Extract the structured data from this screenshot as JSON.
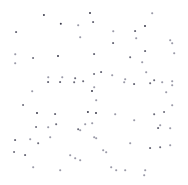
{
  "figure": {
    "width": 188,
    "height": 185,
    "background_color": "#ffffff",
    "marker_color": "#3a3a4a",
    "marker_color_faint": "#9a9aa8",
    "has_axes": false,
    "has_frame": false,
    "has_title": false,
    "has_legend": false,
    "has_gridlines": false,
    "has_tick_labels": false
  },
  "chart_data": {
    "type": "scatter",
    "title": "",
    "subtitle": "",
    "xlabel": "",
    "ylabel": "",
    "xlim": [
      0,
      188
    ],
    "ylim": [
      0,
      185
    ],
    "grid": false,
    "legend": null,
    "annotations": [],
    "tick_labels": {
      "x": [],
      "y": []
    },
    "series": [
      {
        "name": "points",
        "color": "#3a3a4a",
        "marker": "circle",
        "marker_size": 2,
        "n_points": 92,
        "points": [
          {
            "x": 44,
            "y": 15,
            "size": 2.2,
            "shade": "dark"
          },
          {
            "x": 90,
            "y": 13,
            "size": 2.0,
            "shade": "dark"
          },
          {
            "x": 152,
            "y": 13,
            "size": 1.6,
            "shade": "faint"
          },
          {
            "x": 61,
            "y": 24,
            "size": 2.4,
            "shade": "dark"
          },
          {
            "x": 16,
            "y": 32,
            "size": 1.8,
            "shade": "mid"
          },
          {
            "x": 78,
            "y": 25,
            "size": 1.6,
            "shade": "faint"
          },
          {
            "x": 93,
            "y": 22,
            "size": 1.8,
            "shade": "mid"
          },
          {
            "x": 113,
            "y": 31,
            "size": 1.5,
            "shade": "faint"
          },
          {
            "x": 135,
            "y": 31,
            "size": 1.8,
            "shade": "mid"
          },
          {
            "x": 145,
            "y": 26,
            "size": 2.0,
            "shade": "dark"
          },
          {
            "x": 80,
            "y": 37,
            "size": 1.6,
            "shade": "faint"
          },
          {
            "x": 136,
            "y": 38,
            "size": 1.6,
            "shade": "faint"
          },
          {
            "x": 170,
            "y": 40,
            "size": 1.6,
            "shade": "faint"
          },
          {
            "x": 113,
            "y": 43,
            "size": 1.8,
            "shade": "mid"
          },
          {
            "x": 172,
            "y": 43,
            "size": 1.6,
            "shade": "faint"
          },
          {
            "x": 15,
            "y": 54,
            "size": 1.5,
            "shade": "faint"
          },
          {
            "x": 33,
            "y": 58,
            "size": 1.9,
            "shade": "mid"
          },
          {
            "x": 58,
            "y": 56,
            "size": 2.0,
            "shade": "dark"
          },
          {
            "x": 94,
            "y": 54,
            "size": 1.8,
            "shade": "mid"
          },
          {
            "x": 130,
            "y": 57,
            "size": 1.7,
            "shade": "mid"
          },
          {
            "x": 145,
            "y": 51,
            "size": 1.8,
            "shade": "mid"
          },
          {
            "x": 174,
            "y": 53,
            "size": 1.6,
            "shade": "faint"
          },
          {
            "x": 15,
            "y": 63,
            "size": 1.6,
            "shade": "faint"
          },
          {
            "x": 142,
            "y": 62,
            "size": 1.6,
            "shade": "faint"
          },
          {
            "x": 146,
            "y": 72,
            "size": 1.6,
            "shade": "faint"
          },
          {
            "x": 48,
            "y": 77,
            "size": 1.5,
            "shade": "faint"
          },
          {
            "x": 62,
            "y": 77,
            "size": 1.5,
            "shade": "faint"
          },
          {
            "x": 75,
            "y": 78,
            "size": 1.7,
            "shade": "mid"
          },
          {
            "x": 94,
            "y": 74,
            "size": 1.9,
            "shade": "mid"
          },
          {
            "x": 101,
            "y": 72,
            "size": 1.8,
            "shade": "mid"
          },
          {
            "x": 112,
            "y": 75,
            "size": 1.6,
            "shade": "faint"
          },
          {
            "x": 125,
            "y": 79,
            "size": 1.6,
            "shade": "faint"
          },
          {
            "x": 154,
            "y": 80,
            "size": 1.7,
            "shade": "mid"
          },
          {
            "x": 172,
            "y": 81,
            "size": 1.6,
            "shade": "faint"
          },
          {
            "x": 48,
            "y": 82,
            "size": 1.8,
            "shade": "mid"
          },
          {
            "x": 60,
            "y": 82,
            "size": 1.8,
            "shade": "mid"
          },
          {
            "x": 74,
            "y": 82,
            "size": 1.7,
            "shade": "mid"
          },
          {
            "x": 83,
            "y": 81,
            "size": 1.7,
            "shade": "mid"
          },
          {
            "x": 92,
            "y": 91,
            "size": 2.0,
            "shade": "dark"
          },
          {
            "x": 32,
            "y": 91,
            "size": 1.6,
            "shade": "faint"
          },
          {
            "x": 124,
            "y": 82,
            "size": 1.6,
            "shade": "faint"
          },
          {
            "x": 134,
            "y": 84,
            "size": 1.8,
            "shade": "mid"
          },
          {
            "x": 150,
            "y": 83,
            "size": 1.7,
            "shade": "mid"
          },
          {
            "x": 162,
            "y": 82,
            "size": 1.6,
            "shade": "faint"
          },
          {
            "x": 172,
            "y": 85,
            "size": 1.6,
            "shade": "faint"
          },
          {
            "x": 94,
            "y": 87,
            "size": 1.6,
            "shade": "faint"
          },
          {
            "x": 166,
            "y": 92,
            "size": 1.6,
            "shade": "faint"
          },
          {
            "x": 23,
            "y": 105,
            "size": 1.9,
            "shade": "mid"
          },
          {
            "x": 96,
            "y": 100,
            "size": 1.6,
            "shade": "faint"
          },
          {
            "x": 172,
            "y": 105,
            "size": 1.6,
            "shade": "faint"
          },
          {
            "x": 37,
            "y": 113,
            "size": 2.0,
            "shade": "dark"
          },
          {
            "x": 55,
            "y": 114,
            "size": 1.8,
            "shade": "mid"
          },
          {
            "x": 88,
            "y": 112,
            "size": 2.2,
            "shade": "dark"
          },
          {
            "x": 96,
            "y": 113,
            "size": 2.0,
            "shade": "dark"
          },
          {
            "x": 115,
            "y": 114,
            "size": 1.6,
            "shade": "faint"
          },
          {
            "x": 134,
            "y": 120,
            "size": 1.6,
            "shade": "faint"
          },
          {
            "x": 154,
            "y": 114,
            "size": 1.7,
            "shade": "mid"
          },
          {
            "x": 164,
            "y": 112,
            "size": 1.9,
            "shade": "mid"
          },
          {
            "x": 56,
            "y": 124,
            "size": 1.7,
            "shade": "mid"
          },
          {
            "x": 85,
            "y": 124,
            "size": 1.6,
            "shade": "faint"
          },
          {
            "x": 92,
            "y": 123,
            "size": 1.6,
            "shade": "faint"
          },
          {
            "x": 160,
            "y": 125,
            "size": 1.6,
            "shade": "faint"
          },
          {
            "x": 36,
            "y": 127,
            "size": 1.9,
            "shade": "mid"
          },
          {
            "x": 48,
            "y": 127,
            "size": 1.6,
            "shade": "faint"
          },
          {
            "x": 78,
            "y": 129,
            "size": 1.7,
            "shade": "mid"
          },
          {
            "x": 158,
            "y": 128,
            "size": 1.8,
            "shade": "mid"
          },
          {
            "x": 170,
            "y": 128,
            "size": 1.6,
            "shade": "faint"
          },
          {
            "x": 15,
            "y": 140,
            "size": 1.8,
            "shade": "mid"
          },
          {
            "x": 30,
            "y": 139,
            "size": 1.6,
            "shade": "faint"
          },
          {
            "x": 38,
            "y": 143,
            "size": 1.7,
            "shade": "mid"
          },
          {
            "x": 50,
            "y": 137,
            "size": 1.6,
            "shade": "faint"
          },
          {
            "x": 80,
            "y": 130,
            "size": 1.6,
            "shade": "faint"
          },
          {
            "x": 94,
            "y": 137,
            "size": 1.6,
            "shade": "faint"
          },
          {
            "x": 96,
            "y": 138,
            "size": 1.6,
            "shade": "faint"
          },
          {
            "x": 130,
            "y": 143,
            "size": 1.6,
            "shade": "faint"
          },
          {
            "x": 150,
            "y": 148,
            "size": 1.8,
            "shade": "mid"
          },
          {
            "x": 160,
            "y": 147,
            "size": 1.7,
            "shade": "mid"
          },
          {
            "x": 170,
            "y": 145,
            "size": 1.6,
            "shade": "faint"
          },
          {
            "x": 14,
            "y": 152,
            "size": 1.9,
            "shade": "mid"
          },
          {
            "x": 25,
            "y": 155,
            "size": 1.8,
            "shade": "mid"
          },
          {
            "x": 70,
            "y": 155,
            "size": 1.6,
            "shade": "faint"
          },
          {
            "x": 75,
            "y": 158,
            "size": 1.6,
            "shade": "faint"
          },
          {
            "x": 80,
            "y": 160,
            "size": 1.6,
            "shade": "faint"
          },
          {
            "x": 103,
            "y": 150,
            "size": 1.6,
            "shade": "faint"
          },
          {
            "x": 106,
            "y": 152,
            "size": 1.6,
            "shade": "faint"
          },
          {
            "x": 33,
            "y": 167,
            "size": 1.6,
            "shade": "faint"
          },
          {
            "x": 60,
            "y": 170,
            "size": 1.6,
            "shade": "faint"
          },
          {
            "x": 111,
            "y": 167,
            "size": 1.6,
            "shade": "faint"
          },
          {
            "x": 116,
            "y": 170,
            "size": 1.6,
            "shade": "faint"
          },
          {
            "x": 125,
            "y": 170,
            "size": 1.6,
            "shade": "faint"
          },
          {
            "x": 144,
            "y": 175,
            "size": 1.6,
            "shade": "faint"
          },
          {
            "x": 145,
            "y": 170,
            "size": 1.6,
            "shade": "faint"
          }
        ]
      }
    ]
  }
}
